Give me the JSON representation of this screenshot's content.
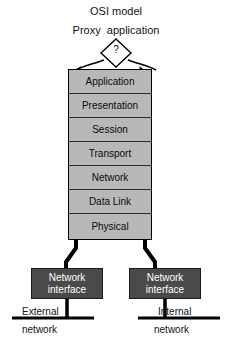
{
  "diagram": {
    "title": "OSI model",
    "subtitle": "Proxy  application",
    "proxy_node": {
      "shape": "diamond",
      "label": "?"
    },
    "osi_stack": {
      "layers": [
        {
          "label": "Application"
        },
        {
          "label": "Presentation"
        },
        {
          "label": "Session"
        },
        {
          "label": "Transport"
        },
        {
          "label": "Network"
        },
        {
          "label": "Data Link"
        },
        {
          "label": "Physical"
        }
      ]
    },
    "interfaces": [
      {
        "id": "external",
        "line1": "Network",
        "line2": "interface"
      },
      {
        "id": "internal",
        "line1": "Network",
        "line2": "interface"
      }
    ],
    "networks": [
      {
        "id": "external",
        "line1": "External",
        "line2": "network"
      },
      {
        "id": "internal",
        "line1": "Internal",
        "line2": "network"
      }
    ],
    "colors": {
      "layer_fill": "#b8b8b8",
      "layer_stroke": "#2a2a2a",
      "nic_fill": "#4a4a4a",
      "nic_text": "#ffffff",
      "line": "#000000",
      "background": "#ffffff"
    }
  }
}
